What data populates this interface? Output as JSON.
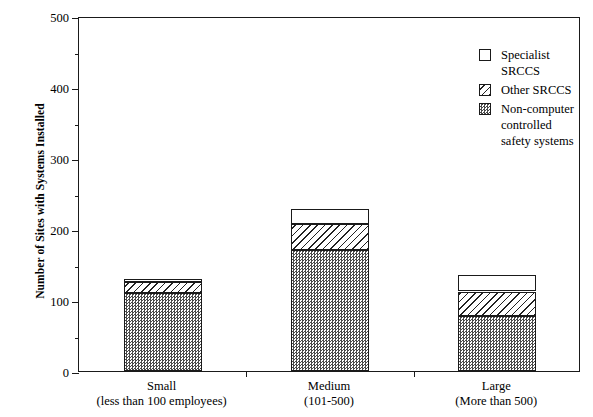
{
  "chart_data": {
    "type": "bar",
    "stacked": true,
    "title": "",
    "xlabel": "",
    "ylabel": "Number of Sites with Systems Installed",
    "ylim": [
      0,
      500
    ],
    "ytick_values": [
      0,
      100,
      200,
      300,
      400,
      500
    ],
    "ytick_labels": [
      "0",
      "100",
      "200",
      "300",
      "400",
      "500"
    ],
    "yminor_values": [
      50,
      150,
      250,
      350,
      450
    ],
    "grid": false,
    "legend_position": "top-right",
    "categories": [
      "Small",
      "Medium",
      "Large"
    ],
    "category_sublabels": [
      "(less than 100 employees)",
      "(101-500)",
      "(More than 500)"
    ],
    "series": [
      {
        "name": "Non-computer controlled safety systems",
        "fill": "checkerboard",
        "values": [
          110,
          170,
          78
        ]
      },
      {
        "name": "Other SRCCS",
        "fill": "diagonal-hatch",
        "values": [
          15,
          37,
          34
        ]
      },
      {
        "name": "Specialist SRCCS",
        "fill": "empty",
        "values": [
          5,
          21,
          23
        ]
      }
    ],
    "stack_tops": [
      [
        110,
        125,
        130
      ],
      [
        170,
        207,
        228
      ],
      [
        78,
        112,
        135
      ]
    ],
    "legend_entries": [
      {
        "label": "Specialist SRCCS",
        "fill": "empty"
      },
      {
        "label": "Other SRCCS",
        "fill": "diagonal-hatch"
      },
      {
        "label": "Non-computer controlled\nsafety systems",
        "fill": "checkerboard"
      }
    ],
    "colors": {
      "axis": "#1a1a1a",
      "bar_outline": "#1a1a1a",
      "checker_dark": "#4a4a4a",
      "background": "#ffffff"
    }
  }
}
